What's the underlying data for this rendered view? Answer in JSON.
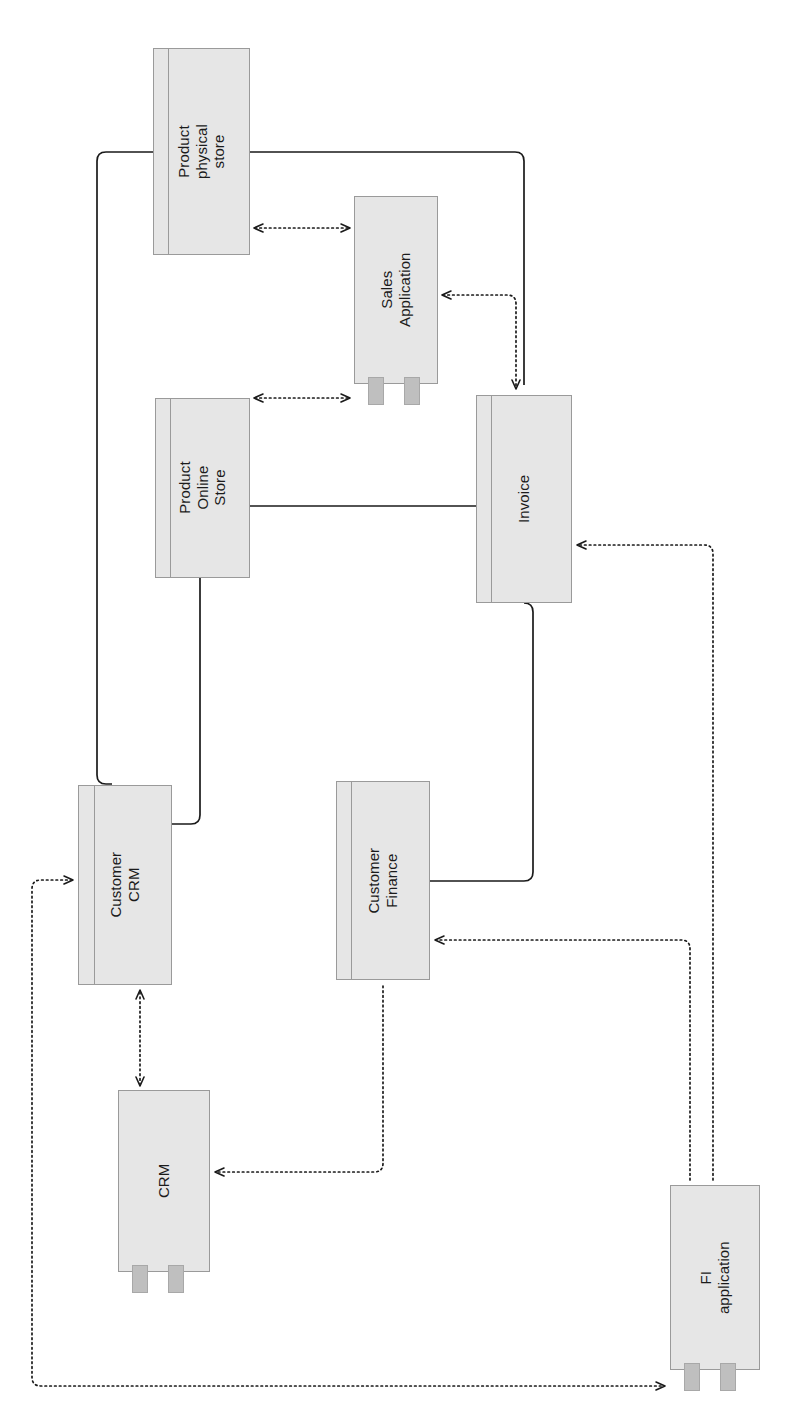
{
  "diagram": {
    "orientation": "rotated-90-ccw",
    "style": {
      "node_fill": "#E6E6E6",
      "node_stroke": "#9a9a9a",
      "tab_fill": "#BFBFBF",
      "line_color": "#1a1a1a",
      "background": "#FFFFFF"
    },
    "nodes": [
      {
        "id": "product-physical-store",
        "label": "Product physical\nstore",
        "kind": "data-object",
        "has_tabs": false,
        "x": 153,
        "y": 48,
        "w": 97,
        "h": 207,
        "band": 14,
        "font_size": 15
      },
      {
        "id": "sales-application",
        "label": "Sales Application",
        "kind": "component",
        "has_tabs": true,
        "x": 354,
        "y": 196,
        "w": 84,
        "h": 188,
        "font_size": 15
      },
      {
        "id": "product-online-store",
        "label": "Product Online\nStore",
        "kind": "data-object",
        "has_tabs": false,
        "x": 155,
        "y": 398,
        "w": 95,
        "h": 180,
        "band": 14,
        "font_size": 15
      },
      {
        "id": "invoice",
        "label": "Invoice",
        "kind": "data-object",
        "has_tabs": false,
        "x": 476,
        "y": 395,
        "w": 96,
        "h": 208,
        "band": 14,
        "font_size": 15
      },
      {
        "id": "customer-crm",
        "label": "Customer CRM",
        "kind": "data-object",
        "has_tabs": false,
        "x": 78,
        "y": 785,
        "w": 94,
        "h": 200,
        "band": 15,
        "font_size": 15
      },
      {
        "id": "customer-finance",
        "label": "Customer Finance",
        "kind": "data-object",
        "has_tabs": false,
        "x": 336,
        "y": 781,
        "w": 94,
        "h": 199,
        "band": 14,
        "font_size": 15
      },
      {
        "id": "crm",
        "label": "CRM",
        "kind": "component",
        "has_tabs": true,
        "x": 118,
        "y": 1090,
        "w": 92,
        "h": 182,
        "font_size": 15
      },
      {
        "id": "fi-application",
        "label": "FI application",
        "kind": "component",
        "has_tabs": true,
        "x": 670,
        "y": 1185,
        "w": 90,
        "h": 185,
        "font_size": 15
      }
    ],
    "edges": [
      {
        "id": "e-physstore-crmcust",
        "from": "product-physical-store",
        "to": "customer-crm",
        "style": "solid",
        "arrow": "none"
      },
      {
        "id": "e-physstore-invoice",
        "from": "product-physical-store",
        "to": "invoice",
        "style": "solid",
        "arrow": "none"
      },
      {
        "id": "e-onlinestore-invoice",
        "from": "product-online-store",
        "to": "invoice",
        "style": "solid",
        "arrow": "none"
      },
      {
        "id": "e-onlinestore-crmcust",
        "from": "product-online-store",
        "to": "customer-crm",
        "style": "solid",
        "arrow": "none"
      },
      {
        "id": "e-custfinance-invoice",
        "from": "customer-finance",
        "to": "invoice",
        "style": "solid",
        "arrow": "none"
      },
      {
        "id": "e-physstore-salesapp",
        "from": "product-physical-store",
        "to": "sales-application",
        "style": "dotted",
        "arrow": "both"
      },
      {
        "id": "e-onlinestore-salesapp",
        "from": "product-online-store",
        "to": "sales-application",
        "style": "dotted",
        "arrow": "both"
      },
      {
        "id": "e-salesapp-invoice",
        "from": "sales-application",
        "to": "invoice",
        "style": "dotted",
        "arrow": "to"
      },
      {
        "id": "e-crmcust-crm",
        "from": "customer-crm",
        "to": "crm",
        "style": "dotted",
        "arrow": "both"
      },
      {
        "id": "e-fiapp-invoice",
        "from": "fi-application",
        "to": "invoice",
        "style": "dotted",
        "arrow": "to"
      },
      {
        "id": "e-fiapp-custfinance",
        "from": "fi-application",
        "to": "customer-finance",
        "style": "dotted",
        "arrow": "to"
      },
      {
        "id": "e-custfinance-crm",
        "from": "customer-finance",
        "to": "crm",
        "style": "dotted",
        "arrow": "to"
      },
      {
        "id": "e-crmcust-fiapp",
        "from": "customer-crm",
        "to": "fi-application",
        "style": "dotted",
        "arrow": "both"
      }
    ]
  }
}
